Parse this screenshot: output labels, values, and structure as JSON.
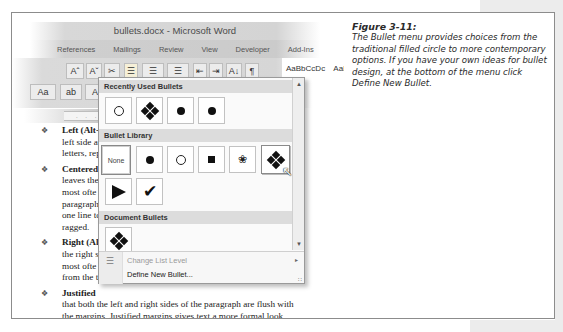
{
  "window": {
    "title": "bullets.docx - Microsoft Word",
    "tabs": [
      "References",
      "Mailings",
      "Review",
      "View",
      "Developer",
      "Add-Ins"
    ]
  },
  "ribbon": {
    "font_grow": "Aˆ",
    "font_shrink": "Aˇ",
    "clear_format": "✂",
    "bullets": "☰",
    "numbering": "☰",
    "multilevel": "☰",
    "decrease_indent": "⇤",
    "increase_indent": "⇥",
    "sort": "A↓",
    "show_marks": "¶",
    "change_case": "Aa",
    "highlight": "ab",
    "font_color": "A",
    "styles_sample": "AaBbCcDc",
    "styles_sample2": "AaB",
    "styles_label": "No"
  },
  "ruler": {
    "ticks": ". . . 1 . . . 1 . . 1"
  },
  "document": {
    "bullet_glyph": "❖",
    "paragraphs": [
      {
        "heading": "Left (Alt-",
        "lines": [
          "left side a",
          "letters, rep"
        ]
      },
      {
        "heading": "Centered",
        "lines": [
          "leaves the",
          "most ofte",
          "paragraph",
          "one line to",
          "ragged."
        ]
      },
      {
        "heading": "Right (Al",
        "lines": [
          "the right s",
          "most ofte",
          "from the t"
        ]
      },
      {
        "heading": "Justified",
        "lines": [
          "that both the left and right sides of the paragraph are flush with",
          "the margins. Justified margins gives text a more formal look",
          "suitable for text books or scholarly documents. If your justified"
        ]
      }
    ]
  },
  "bullet_menu": {
    "recent_header": "Recently Used Bullets",
    "library_header": "Bullet Library",
    "document_header": "Document Bullets",
    "none_label": "None",
    "recent": [
      "hollow-circle",
      "four-diamond",
      "filled-circle",
      "filled-circle"
    ],
    "library": [
      "none",
      "filled-circle",
      "hollow-circle",
      "filled-square",
      "sparkle",
      "four-diamond",
      "arrowhead",
      "checkmark"
    ],
    "document": [
      "four-diamond"
    ],
    "hovered_item": "four-diamond",
    "change_list_level": "Change List Level",
    "define_new_bullet": "Define New Bullet...",
    "scroll_up": "▲",
    "scroll_down": "▼",
    "submenu_arrow": "▸"
  },
  "caption": {
    "figure": "Figure 3-11:",
    "text": "The Bullet menu provides choices from the traditional filled circle to more contemporary options. If you have your own ideas for bullet design, at the bottom of the menu click Define New Bullet."
  }
}
